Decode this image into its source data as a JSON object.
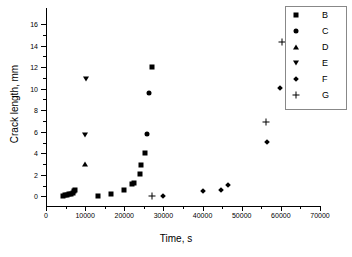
{
  "chart_data": {
    "type": "scatter",
    "title": "",
    "xlabel": "Time, s",
    "ylabel": "Crack length, mm",
    "xlim": [
      0,
      70000
    ],
    "ylim": [
      -0.9,
      17.5
    ],
    "grid": false,
    "legend_position": "top-right",
    "xticks": [
      0,
      10000,
      20000,
      30000,
      40000,
      50000,
      60000,
      70000
    ],
    "xticklabels": [
      "0",
      "10000",
      "20000",
      "30000",
      "40000",
      "50000",
      "60000",
      "70000"
    ],
    "yticks": [
      0,
      2,
      4,
      6,
      8,
      10,
      12,
      14,
      16
    ],
    "yticklabels": [
      "0",
      "2",
      "4",
      "6",
      "8",
      "10",
      "12",
      "14",
      "16"
    ],
    "series": [
      {
        "name": "B",
        "marker": "square",
        "points": [
          [
            4300,
            0.05
          ],
          [
            4800,
            0.08
          ],
          [
            5300,
            0.12
          ],
          [
            5800,
            0.18
          ],
          [
            6300,
            0.26
          ],
          [
            6800,
            0.35
          ],
          [
            7100,
            0.48
          ],
          [
            7400,
            0.58
          ],
          [
            13200,
            0.05
          ],
          [
            16700,
            0.22
          ],
          [
            20000,
            0.6
          ],
          [
            21900,
            1.15
          ],
          [
            22400,
            1.25
          ],
          [
            24000,
            2.1
          ],
          [
            24300,
            2.9
          ],
          [
            25400,
            4.05
          ],
          [
            27000,
            12.0
          ]
        ]
      },
      {
        "name": "C",
        "marker": "circle",
        "points": [
          [
            25900,
            5.78
          ],
          [
            26300,
            9.6
          ]
        ]
      },
      {
        "name": "D",
        "marker": "triangle-up",
        "points": [
          [
            10000,
            3.02
          ]
        ]
      },
      {
        "name": "E",
        "marker": "triangle-down",
        "points": [
          [
            9900,
            5.68
          ],
          [
            10200,
            10.9
          ]
        ]
      },
      {
        "name": "F",
        "marker": "diamond",
        "points": [
          [
            29800,
            0.05
          ],
          [
            40000,
            0.45
          ],
          [
            44700,
            0.58
          ],
          [
            46600,
            1.05
          ],
          [
            56400,
            5.05
          ],
          [
            59800,
            10.1
          ],
          [
            62800,
            12.08
          ]
        ]
      },
      {
        "name": "G",
        "marker": "plus",
        "points": [
          [
            27200,
            0.05
          ],
          [
            56300,
            6.95
          ],
          [
            60400,
            14.3
          ],
          [
            63000,
            16.75
          ]
        ]
      }
    ]
  },
  "legend": {
    "entries": [
      {
        "label": "B",
        "marker": "square"
      },
      {
        "label": "C",
        "marker": "circle"
      },
      {
        "label": "D",
        "marker": "triangle-up"
      },
      {
        "label": "E",
        "marker": "triangle-down"
      },
      {
        "label": "F",
        "marker": "diamond"
      },
      {
        "label": "G",
        "marker": "plus"
      }
    ]
  },
  "colors": {
    "marker": "#000000",
    "axis": "#000000",
    "legend_border": "#888888",
    "background": "#ffffff"
  }
}
